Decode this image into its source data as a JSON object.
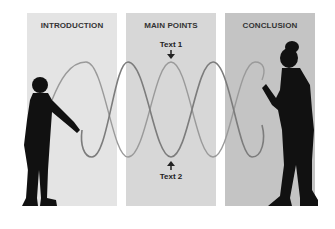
{
  "sections": [
    {
      "id": "introduction",
      "label": "INTRODUCTION",
      "bg": "#e4e4e4"
    },
    {
      "id": "main-points",
      "label": "MAIN POINTS",
      "bg": "#d7d7d7"
    },
    {
      "id": "conclusion",
      "label": "CONCLUSION",
      "bg": "#c4c4c4"
    }
  ],
  "annotations": {
    "top_label": "Text 1",
    "bottom_label": "Text 2"
  },
  "colors": {
    "rope": "#8a8a8a",
    "silhouette": "#111111"
  }
}
